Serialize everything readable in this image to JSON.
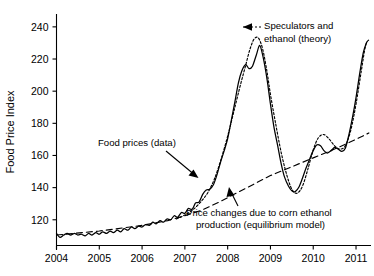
{
  "chart_data": {
    "type": "line",
    "title": "",
    "xlabel": "",
    "ylabel": "Food Price Index",
    "xlim": [
      2004.0,
      2011.35
    ],
    "ylim": [
      104,
      248
    ],
    "grid": false,
    "legend_position": "inline-annotations",
    "xticks": [
      "2004",
      "2005",
      "2006",
      "2007",
      "2008",
      "2009",
      "2010",
      "2011"
    ],
    "xtick_values": [
      2004,
      2005,
      2006,
      2007,
      2008,
      2009,
      2010,
      2011
    ],
    "yticks": [
      "120",
      "140",
      "160",
      "180",
      "200",
      "220",
      "240"
    ],
    "ytick_values": [
      120,
      140,
      160,
      180,
      200,
      220,
      240
    ],
    "series": [
      {
        "name": "Food prices (data)",
        "style": "solid",
        "x": [
          2004.0,
          2004.08,
          2004.17,
          2004.25,
          2004.33,
          2004.42,
          2004.5,
          2004.58,
          2004.67,
          2004.75,
          2004.83,
          2004.92,
          2005.0,
          2005.08,
          2005.17,
          2005.25,
          2005.33,
          2005.42,
          2005.5,
          2005.58,
          2005.67,
          2005.75,
          2005.83,
          2005.92,
          2006.0,
          2006.08,
          2006.17,
          2006.25,
          2006.33,
          2006.42,
          2006.5,
          2006.58,
          2006.67,
          2006.75,
          2006.83,
          2006.92,
          2007.0,
          2007.08,
          2007.17,
          2007.25,
          2007.33,
          2007.42,
          2007.5,
          2007.58,
          2007.67,
          2007.75,
          2007.83,
          2007.92,
          2008.0,
          2008.08,
          2008.17,
          2008.25,
          2008.33,
          2008.42,
          2008.5,
          2008.58,
          2008.67,
          2008.75,
          2008.83,
          2008.92,
          2009.0,
          2009.08,
          2009.17,
          2009.25,
          2009.33,
          2009.42,
          2009.5,
          2009.58,
          2009.67,
          2009.75,
          2009.83,
          2009.92,
          2010.0,
          2010.08,
          2010.17,
          2010.25,
          2010.33,
          2010.42,
          2010.5,
          2010.58,
          2010.67,
          2010.75,
          2010.83,
          2010.92,
          2011.0,
          2011.08,
          2011.17,
          2011.25
        ],
        "y": [
          111.5,
          109.0,
          110.5,
          111.5,
          110.5,
          111.5,
          110.5,
          111.0,
          110.0,
          111.5,
          110.5,
          112.0,
          111.0,
          112.5,
          111.5,
          113.0,
          112.0,
          113.5,
          112.5,
          114.5,
          113.5,
          115.5,
          114.5,
          116.0,
          115.5,
          117.0,
          116.5,
          118.5,
          117.5,
          119.5,
          118.5,
          120.5,
          120.0,
          122.5,
          121.5,
          124.5,
          124.0,
          127.0,
          126.5,
          130.5,
          131.0,
          136.0,
          138.5,
          139.0,
          142.0,
          148.0,
          155.5,
          163.0,
          170.5,
          181.0,
          193.5,
          205.0,
          212.5,
          216.5,
          214.0,
          215.5,
          222.5,
          228.5,
          221.0,
          207.5,
          192.0,
          178.0,
          166.0,
          155.0,
          146.5,
          141.0,
          138.0,
          137.5,
          140.5,
          146.0,
          152.0,
          158.0,
          163.0,
          166.5,
          166.0,
          163.0,
          161.5,
          163.0,
          165.0,
          164.0,
          162.5,
          164.5,
          172.5,
          184.0,
          196.0,
          210.0,
          224.0,
          230.5
        ]
      },
      {
        "name": "Speculators and ethanol (theory)",
        "style": "dotted",
        "x": [
          2006.8,
          2007.0,
          2007.2,
          2007.4,
          2007.55,
          2007.7,
          2007.85,
          2008.0,
          2008.15,
          2008.3,
          2008.42,
          2008.52,
          2008.62,
          2008.72,
          2008.82,
          2008.92,
          2009.0,
          2009.12,
          2009.25,
          2009.38,
          2009.5,
          2009.62,
          2009.75,
          2009.88,
          2010.0,
          2010.12,
          2010.25,
          2010.38,
          2010.5,
          2010.62,
          2010.75,
          2010.88,
          2011.0,
          2011.12,
          2011.22,
          2011.3
        ],
        "y": [
          120.5,
          123.0,
          126.5,
          132.0,
          137.5,
          146.0,
          158.0,
          172.0,
          188.0,
          204.0,
          216.0,
          226.0,
          232.5,
          233.0,
          226.0,
          212.0,
          198.0,
          180.0,
          162.0,
          148.0,
          139.0,
          136.5,
          141.0,
          152.0,
          163.5,
          171.0,
          173.0,
          170.0,
          166.0,
          164.0,
          166.0,
          176.0,
          192.0,
          212.0,
          228.0,
          232.0
        ]
      },
      {
        "name": "Price changes due to corn ethanol production (equilibrium model)",
        "style": "dashed",
        "x": [
          2004.0,
          2005.0,
          2006.0,
          2006.6,
          2007.0,
          2007.4,
          2007.8,
          2008.2,
          2008.6,
          2009.0,
          2009.5,
          2010.0,
          2010.5,
          2011.0,
          2011.3
        ],
        "y": [
          110.5,
          113.0,
          116.5,
          119.5,
          122.5,
          126.0,
          131.0,
          136.5,
          142.0,
          147.5,
          153.0,
          158.5,
          164.0,
          170.0,
          174.0
        ]
      }
    ],
    "annotations": [
      {
        "id": "speculators",
        "lines": [
          "Speculators and",
          "ethanol (theory)"
        ],
        "text": "Speculators and ethanol (theory)",
        "target_x": 2008.62,
        "target_y": 232.5,
        "arrow": "dotted-left"
      },
      {
        "id": "food-prices",
        "lines": [
          "Food prices (data)"
        ],
        "text": "Food prices (data)",
        "target_x": 2007.62,
        "target_y": 140.0,
        "arrow": "solid-down-right"
      },
      {
        "id": "equilibrium",
        "lines": [
          "Price changes due to corn ethanol",
          "production (equilibrium model)"
        ],
        "text": "Price changes due to corn ethanol production (equilibrium model)",
        "target_x": 2008.9,
        "target_y": 146.5,
        "arrow": "solid-up"
      }
    ]
  }
}
